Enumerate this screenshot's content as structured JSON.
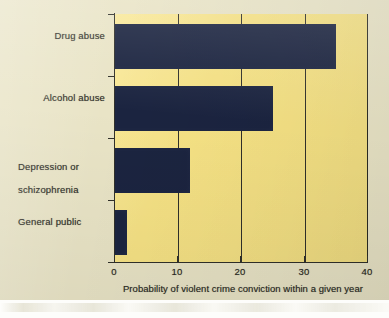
{
  "chart_data": {
    "type": "bar",
    "orientation": "horizontal",
    "title": "",
    "subtitle": "",
    "xlabel": "Probability of violent crime conviction within a given year",
    "ylabel": "",
    "categories": [
      "Drug abuse",
      "Alcohol abuse",
      "Depression or\nschizophrenia",
      "General public"
    ],
    "values": [
      35,
      25,
      12,
      2
    ],
    "xlim": [
      0,
      40
    ],
    "xticks": [
      0,
      10,
      20,
      30,
      40
    ],
    "xtick_labels": [
      "0",
      "10",
      "20",
      "30",
      "40"
    ],
    "grid": true,
    "grid_axis": "x",
    "legend": false,
    "legend_position": "none",
    "bar_color": "#1b2440",
    "plot_background_color": "#f7e385",
    "page_background_color": "#e9e4c6",
    "axis_color": "#30302a",
    "text_color": "#2b2b25"
  },
  "labels": {
    "category_0": "Drug abuse",
    "category_1": "Alcohol abuse",
    "category_2_line1": "Depression or",
    "category_2_line2": "schizophrenia",
    "category_3": "General public",
    "xtick_0": "0",
    "xtick_1": "10",
    "xtick_2": "20",
    "xtick_3": "30",
    "xtick_4": "40",
    "x_axis_title": "Probability of violent crime conviction within a given year"
  }
}
